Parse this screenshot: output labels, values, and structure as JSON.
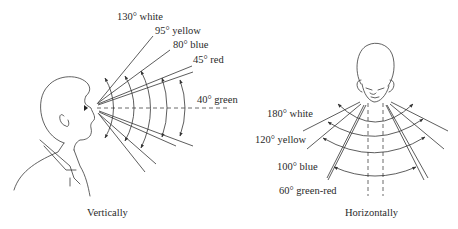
{
  "figure": {
    "colors": {
      "line": "#333333",
      "text": "#2a2a2a",
      "background": "#ffffff"
    }
  },
  "vertical": {
    "caption": "Vertically",
    "labels": [
      {
        "angle": "130°",
        "color": "white",
        "text": "130° white"
      },
      {
        "angle": "95°",
        "color": "yellow",
        "text": "95° yellow"
      },
      {
        "angle": "80°",
        "color": "blue",
        "text": "80° blue"
      },
      {
        "angle": "45°",
        "color": "red",
        "text": "45° red"
      },
      {
        "angle": "40°",
        "color": "green",
        "text": "40° green"
      }
    ]
  },
  "horizontal": {
    "caption": "Horizontally",
    "labels": [
      {
        "angle": "180°",
        "color": "white",
        "text": "180° white"
      },
      {
        "angle": "120°",
        "color": "yellow",
        "text": "120° yellow"
      },
      {
        "angle": "100°",
        "color": "blue",
        "text": "100° blue"
      },
      {
        "angle": "60°",
        "color": "green-red",
        "text": "60° green-red"
      }
    ]
  }
}
